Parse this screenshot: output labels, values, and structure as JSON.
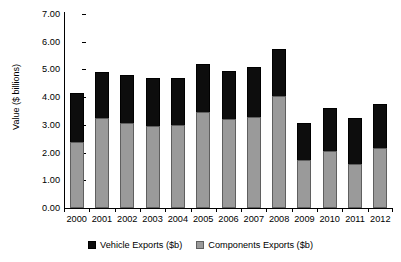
{
  "chart_data": {
    "type": "bar",
    "subtype": "stacked-vertical",
    "title": "",
    "subtitle": "",
    "xlabel": "",
    "ylabel": "Value ($ billions)",
    "categories": [
      "2000",
      "2001",
      "2002",
      "2003",
      "2004",
      "2005",
      "2006",
      "2007",
      "2008",
      "2009",
      "2010",
      "2011",
      "2012"
    ],
    "series": [
      {
        "name": "Components Exports ($b)",
        "color": "#9a9a9a",
        "values": [
          2.4,
          3.25,
          3.05,
          2.95,
          3.0,
          3.45,
          3.2,
          3.3,
          4.05,
          1.75,
          2.05,
          1.6,
          2.15
        ]
      },
      {
        "name": "Vehicle Exports ($b)",
        "color": "#0d0d0d",
        "values": [
          1.75,
          1.65,
          1.75,
          1.75,
          1.7,
          1.75,
          1.75,
          1.8,
          1.7,
          1.3,
          1.55,
          1.65,
          1.6
        ]
      }
    ],
    "totals": [
      4.15,
      4.9,
      4.8,
      4.7,
      4.7,
      5.2,
      4.95,
      5.1,
      5.75,
      3.05,
      3.6,
      3.25,
      3.75
    ],
    "ylim": [
      0,
      7
    ],
    "ytick_values": [
      0,
      1,
      2,
      3,
      4,
      5,
      6,
      7
    ],
    "ytick_labels": [
      "0.00",
      "1.00",
      "2.00",
      "3.00",
      "4.00",
      "5.00",
      "6.00",
      "7.00"
    ],
    "grid": false,
    "legend_position": "bottom",
    "legend_entries": [
      "Vehicle Exports ($b)",
      "Components Exports ($b)"
    ],
    "stack_order": [
      "Components Exports ($b)",
      "Vehicle Exports ($b)"
    ]
  },
  "legend": {
    "vehicle_label": "Vehicle Exports ($b)",
    "components_label": "Components Exports ($b)"
  },
  "axis": {
    "y_title": "Value ($ billions)"
  }
}
